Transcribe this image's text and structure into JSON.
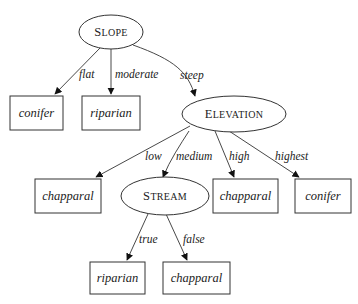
{
  "diagram": {
    "type": "decision-tree",
    "root": {
      "id": "slope",
      "label_initial": "S",
      "label_rest": "LOPE",
      "label": "Slope",
      "branches": [
        {
          "edge": "flat",
          "leaf": "conifer"
        },
        {
          "edge": "moderate",
          "leaf": "riparian"
        },
        {
          "edge": "steep",
          "node": "elevation"
        }
      ]
    },
    "elevation": {
      "id": "elevation",
      "label_initial": "E",
      "label_rest": "LEVATION",
      "label": "Elevation",
      "branches": [
        {
          "edge": "low",
          "leaf": "chapparal"
        },
        {
          "edge": "medium",
          "node": "stream"
        },
        {
          "edge": "high",
          "leaf": "chapparal"
        },
        {
          "edge": "highest",
          "leaf": "conifer"
        }
      ]
    },
    "stream": {
      "id": "stream",
      "label_initial": "S",
      "label_rest": "TREAM",
      "label": "Stream",
      "branches": [
        {
          "edge": "true",
          "leaf": "riparian"
        },
        {
          "edge": "false",
          "leaf": "chapparal"
        }
      ]
    },
    "edges": {
      "flat": "flat",
      "moderate": "moderate",
      "steep": "steep",
      "low": "low",
      "medium": "medium",
      "high": "high",
      "highest": "highest",
      "true": "true",
      "false": "false"
    },
    "leaves": {
      "slope_flat": "conifer",
      "slope_moderate": "riparian",
      "elev_low": "chapparal",
      "elev_high": "chapparal",
      "elev_highest": "conifer",
      "stream_true": "riparian",
      "stream_false": "chapparal"
    }
  }
}
